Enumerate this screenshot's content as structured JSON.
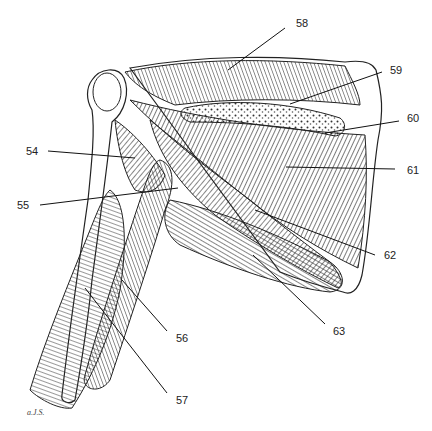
{
  "figure": {
    "signature": "a.J.S.",
    "labels": [
      {
        "id": "54",
        "text": "54",
        "x": 26,
        "y": 146,
        "line": [
          48,
          151,
          135,
          158
        ]
      },
      {
        "id": "55",
        "text": "55",
        "x": 17,
        "y": 200,
        "line": [
          40,
          205,
          178,
          188
        ]
      },
      {
        "id": "56",
        "text": "56",
        "x": 176,
        "y": 333,
        "line": [
          167,
          331,
          122,
          280
        ]
      },
      {
        "id": "57",
        "text": "57",
        "x": 176,
        "y": 395,
        "line": [
          167,
          393,
          85,
          288
        ]
      },
      {
        "id": "58",
        "text": "58",
        "x": 296,
        "y": 18,
        "line": [
          285,
          28,
          228,
          70
        ]
      },
      {
        "id": "59",
        "text": "59",
        "x": 390,
        "y": 65,
        "line": [
          382,
          72,
          290,
          104
        ]
      },
      {
        "id": "60",
        "text": "60",
        "x": 407,
        "y": 113,
        "line": [
          399,
          121,
          325,
          133
        ]
      },
      {
        "id": "61",
        "text": "61",
        "x": 407,
        "y": 165,
        "line": [
          395,
          169,
          286,
          167
        ]
      },
      {
        "id": "62",
        "text": "62",
        "x": 384,
        "y": 250,
        "line": [
          375,
          255,
          255,
          210
        ]
      },
      {
        "id": "63",
        "text": "63",
        "x": 333,
        "y": 326,
        "line": [
          325,
          324,
          253,
          255
        ]
      }
    ]
  }
}
